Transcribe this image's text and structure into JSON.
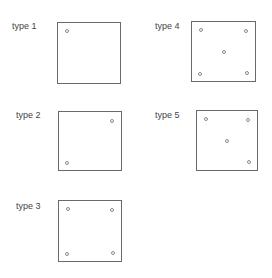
{
  "diagram": {
    "types": [
      {
        "id": 1,
        "label": "type 1",
        "points": [
          "top-left"
        ]
      },
      {
        "id": 2,
        "label": "type 2",
        "points": [
          "top-right",
          "bottom-left"
        ]
      },
      {
        "id": 3,
        "label": "type 3",
        "points": [
          "top-left",
          "top-right",
          "bottom-left",
          "bottom-right"
        ]
      },
      {
        "id": 4,
        "label": "type 4",
        "points": [
          "top-left",
          "top-right",
          "center",
          "bottom-left",
          "bottom-right"
        ]
      },
      {
        "id": 5,
        "label": "type 5",
        "points": [
          "top-left",
          "top-right",
          "center",
          "bottom-right"
        ]
      }
    ],
    "colors": {
      "box_border": "#6a6a6a",
      "point_stroke": "#8a8a8a",
      "label_text": "#444444",
      "background": "#ffffff"
    }
  }
}
